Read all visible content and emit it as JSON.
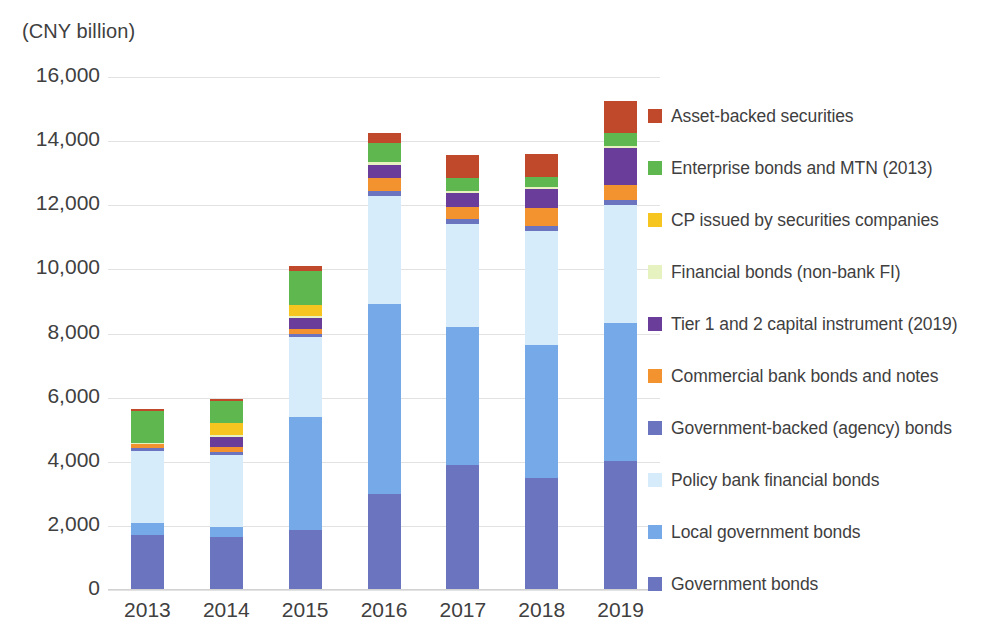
{
  "chart_data": {
    "type": "bar",
    "subtype": "stacked-bar",
    "title": "",
    "unit_label": "(CNY billion)",
    "xlabel": "",
    "ylabel": "",
    "ylim": [
      0,
      16000
    ],
    "ytick_values": [
      0,
      2000,
      4000,
      6000,
      8000,
      10000,
      12000,
      14000,
      16000
    ],
    "ytick_labels": [
      "0",
      "2,000",
      "4,000",
      "6,000",
      "8,000",
      "10,000",
      "12,000",
      "14,000",
      "16,000"
    ],
    "grid": true,
    "legend_position": "right",
    "categories": [
      "2013",
      "2014",
      "2015",
      "2016",
      "2017",
      "2018",
      "2019"
    ],
    "stack_order_bottom_to_top": [
      "Government bonds",
      "Local government bonds",
      "Policy bank financial bonds",
      "Government-backed (agency) bonds",
      "Commercial bank bonds and notes",
      "Tier 1 and 2 capital instrument (2019)",
      "Financial bonds (non-bank FI)",
      "CP issued by securities companies",
      "Enterprise bonds and MTN (2013)",
      "Asset-backed securities"
    ],
    "series": [
      {
        "name": "Government bonds",
        "color": "#6b74bf",
        "values": [
          1720,
          1650,
          1870,
          2990,
          3900,
          3500,
          4010
        ]
      },
      {
        "name": "Local government bonds",
        "color": "#76a9e8",
        "values": [
          370,
          320,
          3540,
          5930,
          4300,
          4150,
          4320
        ]
      },
      {
        "name": "Policy bank financial bonds",
        "color": "#d6ecfa",
        "values": [
          2250,
          2240,
          2470,
          3380,
          3220,
          3540,
          3680
        ]
      },
      {
        "name": "Government-backed (agency) bonds",
        "color": "#6b74bf",
        "values": [
          100,
          110,
          120,
          150,
          150,
          150,
          160
        ]
      },
      {
        "name": "Commercial bank bonds and notes",
        "color": "#f3932f",
        "values": [
          120,
          130,
          150,
          400,
          390,
          560,
          470
        ]
      },
      {
        "name": "Tier 1 and 2 capital instrument (2019)",
        "color": "#6a3d9a",
        "values": [
          0,
          330,
          330,
          420,
          430,
          600,
          1150
        ]
      },
      {
        "name": "Financial bonds (non-bank FI)",
        "color": "#e6f2c0",
        "values": [
          40,
          40,
          60,
          70,
          70,
          70,
          70
        ]
      },
      {
        "name": "CP issued by securities companies",
        "color": "#f6c51f",
        "values": [
          0,
          380,
          360,
          0,
          0,
          0,
          0
        ]
      },
      {
        "name": "Enterprise bonds and MTN (2013)",
        "color": "#5fb84f",
        "values": [
          970,
          690,
          1050,
          610,
          390,
          300,
          400
        ]
      },
      {
        "name": "Asset-backed securities",
        "color": "#c0492c",
        "values": [
          70,
          60,
          170,
          290,
          730,
          720,
          1000
        ]
      }
    ],
    "totals": [
      5640,
      5950,
      10120,
      14240,
      13580,
      13590,
      15260
    ]
  },
  "legend": {
    "items": [
      {
        "label": "Asset-backed securities",
        "color": "#c0492c"
      },
      {
        "label": "Enterprise bonds and MTN (2013)",
        "color": "#5fb84f"
      },
      {
        "label": "CP issued by securities companies",
        "color": "#f6c51f"
      },
      {
        "label": "Financial bonds (non-bank FI)",
        "color": "#e6f2c0"
      },
      {
        "label": "Tier 1 and 2 capital instrument (2019)",
        "color": "#6a3d9a"
      },
      {
        "label": "Commercial bank bonds and notes",
        "color": "#f3932f"
      },
      {
        "label": "Government-backed (agency) bonds",
        "color": "#6b74bf"
      },
      {
        "label": "Policy bank financial bonds",
        "color": "#d6ecfa"
      },
      {
        "label": "Local government bonds",
        "color": "#76a9e8"
      },
      {
        "label": "Government bonds",
        "color": "#6b74bf"
      }
    ]
  }
}
